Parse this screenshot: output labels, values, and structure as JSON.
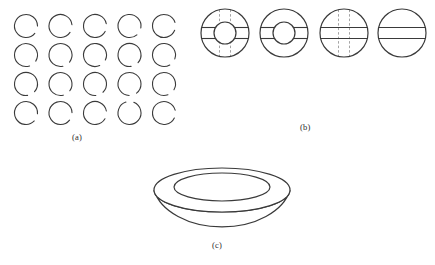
{
  "figure": {
    "background_color": "#ffffff",
    "stroke_color": "#3a3a3a",
    "dash_color": "#9a9a9a",
    "label_color": "#2b2b2b",
    "width": 435,
    "height": 265
  },
  "panels": [
    {
      "id": "a",
      "label": "(a)",
      "label_x": 72,
      "label_y": 132,
      "type": "circle-grid",
      "description": "4 by 5 grid of open circles each with a small gap in the outline",
      "rows": 4,
      "columns": 5,
      "radius": 11.5,
      "gap_degrees": 40,
      "origin_x": 26,
      "origin_y": 26,
      "step_x": 34.5,
      "step_y": 29,
      "circles": [
        {
          "row": 0,
          "col": 0,
          "cx": 26.0,
          "cy": 26.0,
          "gap_center_deg": 20
        },
        {
          "row": 0,
          "col": 1,
          "cx": 60.5,
          "cy": 26.0,
          "gap_center_deg": 14
        },
        {
          "row": 0,
          "col": 2,
          "cx": 95.0,
          "cy": 26.0,
          "gap_center_deg": 8
        },
        {
          "row": 0,
          "col": 3,
          "cx": 129.5,
          "cy": 26.0,
          "gap_center_deg": 30
        },
        {
          "row": 0,
          "col": 4,
          "cx": 164.0,
          "cy": 26.0,
          "gap_center_deg": 2
        },
        {
          "row": 1,
          "col": 0,
          "cx": 26.0,
          "cy": 55.0,
          "gap_center_deg": 52
        },
        {
          "row": 1,
          "col": 1,
          "cx": 60.5,
          "cy": 55.0,
          "gap_center_deg": 58
        },
        {
          "row": 1,
          "col": 2,
          "cx": 95.0,
          "cy": 55.0,
          "gap_center_deg": 46
        },
        {
          "row": 1,
          "col": 3,
          "cx": 129.5,
          "cy": 55.0,
          "gap_center_deg": 62
        },
        {
          "row": 1,
          "col": 4,
          "cx": 164.0,
          "cy": 55.0,
          "gap_center_deg": 40
        },
        {
          "row": 2,
          "col": 0,
          "cx": 26.0,
          "cy": 84.0,
          "gap_center_deg": 62
        },
        {
          "row": 2,
          "col": 1,
          "cx": 60.5,
          "cy": 84.0,
          "gap_center_deg": 56
        },
        {
          "row": 2,
          "col": 2,
          "cx": 95.0,
          "cy": 84.0,
          "gap_center_deg": 66
        },
        {
          "row": 2,
          "col": 3,
          "cx": 129.5,
          "cy": 84.0,
          "gap_center_deg": 72
        },
        {
          "row": 2,
          "col": 4,
          "cx": 164.0,
          "cy": 84.0,
          "gap_center_deg": 50
        },
        {
          "row": 3,
          "col": 0,
          "cx": 26.0,
          "cy": 113.0,
          "gap_center_deg": 24
        },
        {
          "row": 3,
          "col": 1,
          "cx": 60.5,
          "cy": 113.0,
          "gap_center_deg": 18
        },
        {
          "row": 3,
          "col": 2,
          "cx": 95.0,
          "cy": 113.0,
          "gap_center_deg": 10
        },
        {
          "row": 3,
          "col": 3,
          "cx": 129.5,
          "cy": 113.0,
          "gap_center_deg": 272
        },
        {
          "row": 3,
          "col": 4,
          "cx": 164.0,
          "cy": 113.0,
          "gap_center_deg": 6
        }
      ]
    },
    {
      "id": "b",
      "label": "(b)",
      "label_x": 300,
      "label_y": 122,
      "type": "annulus-sequence",
      "description": "Four circular diagrams: annulus with solid and dashed chords, annulus with solid chords only, disk with solid and dashed chords, disk with solid chords only",
      "shapes": [
        {
          "name": "annulus-dashed-and-solid",
          "cx": 225,
          "cy": 33,
          "outer_radius": 24,
          "inner_radius": 11,
          "has_hole": true,
          "solid_chords": "horizontal",
          "dashed_chords": "vertical",
          "band_offset": 5.5
        },
        {
          "name": "annulus-solid-only",
          "cx": 284,
          "cy": 33,
          "outer_radius": 24,
          "inner_radius": 11,
          "has_hole": true,
          "solid_chords": "horizontal",
          "dashed_chords": "none",
          "band_offset": 5.5
        },
        {
          "name": "disk-dashed-and-solid",
          "cx": 344,
          "cy": 33,
          "outer_radius": 24,
          "inner_radius": 0,
          "has_hole": false,
          "solid_chords": "horizontal",
          "dashed_chords": "vertical",
          "band_offset": 5.5
        },
        {
          "name": "disk-solid-only",
          "cx": 402,
          "cy": 33,
          "outer_radius": 24,
          "inner_radius": 0,
          "has_hole": false,
          "solid_chords": "horizontal",
          "dashed_chords": "none",
          "band_offset": 5.5
        }
      ]
    },
    {
      "id": "c",
      "label": "(c)",
      "label_x": 212,
      "label_y": 240,
      "type": "torus",
      "description": "A flattened torus drawn in three-dimensional perspective",
      "cx": 222,
      "cy": 202,
      "outer_rx": 68,
      "outer_ry": 22,
      "inner_rx": 48,
      "inner_ry": 14,
      "body_depth": 24
    }
  ]
}
